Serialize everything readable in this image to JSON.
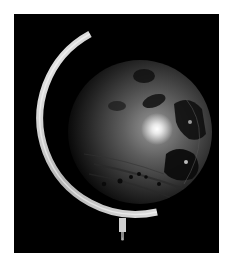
{
  "image": {
    "subject": "Desk globe on a metal meridian arc against a black background",
    "alt": "Globe with meridian arc, dark background, bright light reflection"
  },
  "colors": {
    "page_background": "#ffffff",
    "photo_background": "#000000",
    "arc_highlight": "#e6e6e6",
    "arc_shadow": "#8a8a8a",
    "globe_land": "#6b6b6b",
    "globe_sea": "#1a1a1a",
    "light_reflection": "#ffffff"
  }
}
